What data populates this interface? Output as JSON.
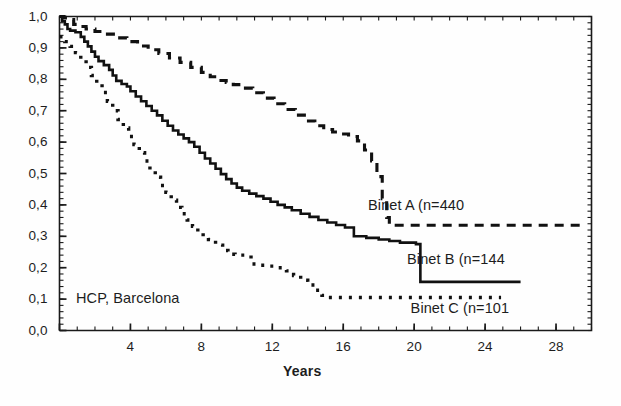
{
  "figure": {
    "background": "#ffffff",
    "ink": "#1a1a1a"
  },
  "annotations": {
    "source_note": "HCP, Barcelona",
    "source_note_pos": {
      "x": 0.9,
      "y": 0.12
    }
  },
  "chart_data": {
    "type": "line",
    "title": "",
    "subtitle": "",
    "xlabel": "Years",
    "ylabel": "",
    "xlim": [
      0,
      30
    ],
    "ylim": [
      0.0,
      1.0
    ],
    "grid": false,
    "legend_position": "inline-right",
    "xticks": [
      0,
      4,
      8,
      12,
      16,
      20,
      24,
      28
    ],
    "xticklabels": [
      "",
      "4",
      "8",
      "12",
      "16",
      "20",
      "24",
      "28"
    ],
    "xminor_step": 1,
    "yticks": [
      0.0,
      0.1,
      0.2,
      0.3,
      0.4,
      0.5,
      0.6,
      0.7,
      0.8,
      0.9,
      1.0
    ],
    "yticklabels": [
      "0,0",
      "0,1",
      "0,2",
      "0,3",
      "0,4",
      "0,5",
      "0,6",
      "0,7",
      "0,8",
      "0,9",
      "1,0"
    ],
    "yminor_step": 0.02,
    "decimal_separator": ",",
    "series": [
      {
        "name": "Binet A (n=440",
        "label": "Binet A (n=440",
        "n": 440,
        "style": "dashed",
        "color": "#111111",
        "linewidth": 3.1,
        "dasharray": "9,7",
        "label_pos": {
          "x": 17.4,
          "y": 0.395
        },
        "plateau_value": 0.335,
        "points": [
          [
            0.0,
            1.0
          ],
          [
            0.25,
            0.995
          ],
          [
            0.5,
            0.99
          ],
          [
            0.8,
            0.975
          ],
          [
            1.1,
            0.968
          ],
          [
            1.5,
            0.96
          ],
          [
            2.0,
            0.952
          ],
          [
            2.6,
            0.944
          ],
          [
            3.2,
            0.932
          ],
          [
            3.8,
            0.92
          ],
          [
            4.4,
            0.906
          ],
          [
            5.0,
            0.894
          ],
          [
            5.6,
            0.882
          ],
          [
            6.2,
            0.868
          ],
          [
            6.8,
            0.854
          ],
          [
            7.4,
            0.838
          ],
          [
            8.0,
            0.822
          ],
          [
            8.5,
            0.808
          ],
          [
            9.0,
            0.796
          ],
          [
            9.4,
            0.79
          ],
          [
            9.8,
            0.783
          ],
          [
            10.3,
            0.772
          ],
          [
            10.9,
            0.757
          ],
          [
            11.5,
            0.74
          ],
          [
            12.1,
            0.722
          ],
          [
            12.7,
            0.704
          ],
          [
            13.3,
            0.686
          ],
          [
            13.9,
            0.667
          ],
          [
            14.4,
            0.652
          ],
          [
            14.9,
            0.64
          ],
          [
            15.4,
            0.632
          ],
          [
            15.9,
            0.626
          ],
          [
            16.3,
            0.618
          ],
          [
            16.8,
            0.604
          ],
          [
            17.2,
            0.575
          ],
          [
            17.6,
            0.54
          ],
          [
            17.9,
            0.49
          ],
          [
            18.2,
            0.42
          ],
          [
            18.45,
            0.36
          ],
          [
            18.6,
            0.335
          ],
          [
            22.0,
            0.335
          ],
          [
            26.0,
            0.335
          ],
          [
            29.5,
            0.335
          ]
        ]
      },
      {
        "name": "Binet B (n=144",
        "label": "Binet B (n=144",
        "n": 144,
        "style": "solid",
        "color": "#111111",
        "linewidth": 2.6,
        "label_pos": {
          "x": 19.6,
          "y": 0.225
        },
        "plateau_value": 0.155,
        "points": [
          [
            0.0,
            1.0
          ],
          [
            0.15,
            0.985
          ],
          [
            0.3,
            0.975
          ],
          [
            0.45,
            0.96
          ],
          [
            0.6,
            0.955
          ],
          [
            0.9,
            0.95
          ],
          [
            1.2,
            0.935
          ],
          [
            1.4,
            0.92
          ],
          [
            1.6,
            0.905
          ],
          [
            1.8,
            0.888
          ],
          [
            2.0,
            0.872
          ],
          [
            2.2,
            0.858
          ],
          [
            2.5,
            0.845
          ],
          [
            2.8,
            0.83
          ],
          [
            3.0,
            0.812
          ],
          [
            3.2,
            0.795
          ],
          [
            3.5,
            0.785
          ],
          [
            3.8,
            0.777
          ],
          [
            4.0,
            0.762
          ],
          [
            4.3,
            0.745
          ],
          [
            4.6,
            0.73
          ],
          [
            4.9,
            0.715
          ],
          [
            5.2,
            0.7
          ],
          [
            5.5,
            0.685
          ],
          [
            5.8,
            0.668
          ],
          [
            6.1,
            0.652
          ],
          [
            6.4,
            0.637
          ],
          [
            6.7,
            0.624
          ],
          [
            7.0,
            0.612
          ],
          [
            7.3,
            0.6
          ],
          [
            7.6,
            0.585
          ],
          [
            7.9,
            0.566
          ],
          [
            8.2,
            0.548
          ],
          [
            8.5,
            0.532
          ],
          [
            8.8,
            0.515
          ],
          [
            9.1,
            0.498
          ],
          [
            9.4,
            0.482
          ],
          [
            9.7,
            0.468
          ],
          [
            10.0,
            0.455
          ],
          [
            10.3,
            0.445
          ],
          [
            10.7,
            0.436
          ],
          [
            11.1,
            0.428
          ],
          [
            11.5,
            0.42
          ],
          [
            11.9,
            0.41
          ],
          [
            12.3,
            0.4
          ],
          [
            12.7,
            0.392
          ],
          [
            13.1,
            0.383
          ],
          [
            13.6,
            0.372
          ],
          [
            14.1,
            0.362
          ],
          [
            14.6,
            0.352
          ],
          [
            15.1,
            0.344
          ],
          [
            15.6,
            0.336
          ],
          [
            16.1,
            0.328
          ],
          [
            16.6,
            0.3
          ],
          [
            17.3,
            0.295
          ],
          [
            18.0,
            0.29
          ],
          [
            18.6,
            0.285
          ],
          [
            19.2,
            0.28
          ],
          [
            20.1,
            0.275
          ],
          [
            20.35,
            0.155
          ],
          [
            23.0,
            0.155
          ],
          [
            26.0,
            0.155
          ]
        ]
      },
      {
        "name": "Binet C (n=101",
        "label": "Binet C (n=101",
        "n": 101,
        "style": "dotted",
        "color": "#111111",
        "linewidth": 3.4,
        "dasharray": "3,7",
        "label_pos": {
          "x": 19.8,
          "y": 0.068
        },
        "plateau_value": 0.105,
        "points": [
          [
            0.0,
            0.935
          ],
          [
            0.3,
            0.92
          ],
          [
            0.6,
            0.905
          ],
          [
            0.9,
            0.885
          ],
          [
            1.2,
            0.862
          ],
          [
            1.5,
            0.838
          ],
          [
            1.8,
            0.812
          ],
          [
            2.1,
            0.786
          ],
          [
            2.4,
            0.758
          ],
          [
            2.7,
            0.73
          ],
          [
            3.0,
            0.7
          ],
          [
            3.3,
            0.672
          ],
          [
            3.6,
            0.645
          ],
          [
            3.9,
            0.618
          ],
          [
            4.2,
            0.592
          ],
          [
            4.5,
            0.566
          ],
          [
            4.8,
            0.54
          ],
          [
            5.1,
            0.512
          ],
          [
            5.4,
            0.488
          ],
          [
            5.7,
            0.462
          ],
          [
            6.0,
            0.44
          ],
          [
            6.3,
            0.415
          ],
          [
            6.6,
            0.392
          ],
          [
            6.9,
            0.372
          ],
          [
            7.2,
            0.352
          ],
          [
            7.5,
            0.332
          ],
          [
            7.8,
            0.315
          ],
          [
            8.1,
            0.3
          ],
          [
            8.4,
            0.29
          ],
          [
            8.8,
            0.272
          ],
          [
            9.2,
            0.255
          ],
          [
            9.5,
            0.243
          ],
          [
            9.9,
            0.24
          ],
          [
            10.3,
            0.24
          ],
          [
            10.8,
            0.212
          ],
          [
            11.3,
            0.208
          ],
          [
            11.8,
            0.205
          ],
          [
            12.3,
            0.2
          ],
          [
            12.8,
            0.19
          ],
          [
            13.2,
            0.175
          ],
          [
            13.6,
            0.16
          ],
          [
            14.0,
            0.145
          ],
          [
            14.4,
            0.128
          ],
          [
            14.8,
            0.112
          ],
          [
            15.1,
            0.105
          ],
          [
            18.0,
            0.105
          ],
          [
            21.0,
            0.105
          ],
          [
            24.9,
            0.105
          ]
        ]
      }
    ]
  }
}
